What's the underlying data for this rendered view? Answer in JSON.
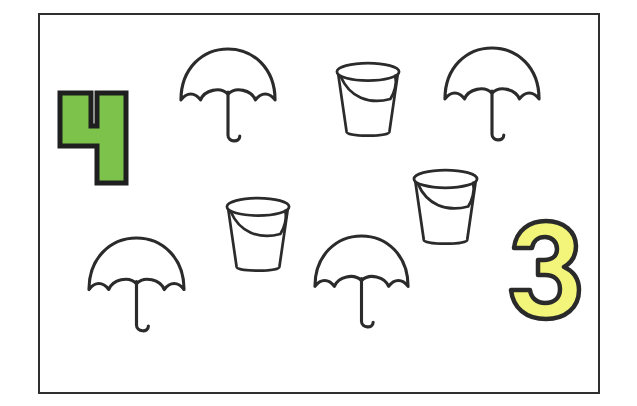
{
  "worksheet": {
    "numbers": [
      {
        "value": "4",
        "color": "#7dc24b",
        "outline": "#1f1f1f",
        "counts": "umbrellas"
      },
      {
        "value": "3",
        "color": "#f3f57a",
        "outline": "#2a2a2a",
        "counts": "buckets"
      }
    ],
    "objects": {
      "umbrella_count": 4,
      "bucket_count": 3,
      "umbrella_icon": "umbrella-icon",
      "bucket_icon": "bucket-icon"
    },
    "stroke_color": "#2b2b2b",
    "border_color": "#2f2f2f"
  }
}
